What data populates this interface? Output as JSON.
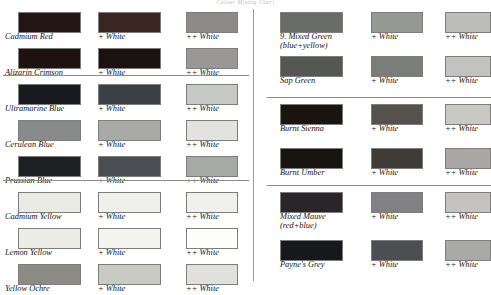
{
  "page": {
    "title": "Colour Mixing Chart",
    "mix_label_1": "+ White",
    "mix_label_2": "++ White"
  },
  "chart_data": {
    "type": "table",
    "title": "Colour Mixing Chart",
    "columns": [
      "Base Colour",
      "+ White",
      "++ White"
    ],
    "panels": [
      {
        "side": "left",
        "groups": [
          {
            "rows": [
              {
                "name": "Cadmium Red",
                "subtitle": "",
                "swatches": [
                  "#231513",
                  "#3a2523",
                  "#8d8a88"
                ]
              },
              {
                "name": "Alizarin Crimson",
                "subtitle": "",
                "swatches": [
                  "#1d1210",
                  "#1a1210",
                  "#9a9896"
                ]
              }
            ]
          },
          {
            "rows": [
              {
                "name": "Ultramarine Blue",
                "subtitle": "",
                "swatches": [
                  "#181a20",
                  "#3c3f45",
                  "#c6c8c6"
                ]
              },
              {
                "name": "Cerulean Blue",
                "subtitle": "",
                "swatches": [
                  "#898b8a",
                  "#a9aaa8",
                  "#e2e3e1"
                ]
              },
              {
                "name": "Prussian Blue",
                "subtitle": "",
                "swatches": [
                  "#1e2024",
                  "#4a4d51",
                  "#a7a9a7"
                ]
              }
            ]
          },
          {
            "rows": [
              {
                "name": "Cadmium Yellow",
                "subtitle": "",
                "swatches": [
                  "#e9eae4",
                  "#eff0ec",
                  "#f0f1ed"
                ]
              },
              {
                "name": "Lemon Yellow",
                "subtitle": "",
                "swatches": [
                  "#ecede7",
                  "#f4f5f1",
                  "#fdfdfc"
                ]
              },
              {
                "name": "Yellow Ochre",
                "subtitle": "",
                "swatches": [
                  "#8c8b85",
                  "#c9cac4",
                  "#e0e1dc"
                ]
              }
            ]
          }
        ]
      },
      {
        "side": "right",
        "groups": [
          {
            "rows": [
              {
                "name": "9. Mixed Green",
                "subtitle": "(blue+yellow)",
                "swatches": [
                  "#6a6c68",
                  "#969893",
                  "#bcbdb8"
                ]
              },
              {
                "name": "Sap Green",
                "subtitle": "",
                "swatches": [
                  "#555753",
                  "#7b7d78",
                  "#c2c3be"
                ]
              }
            ]
          },
          {
            "rows": [
              {
                "name": "Burnt Sienna",
                "subtitle": "",
                "swatches": [
                  "#1a1411",
                  "#55514d",
                  "#c9c8c3"
                ]
              },
              {
                "name": "Burnt Umber",
                "subtitle": "",
                "swatches": [
                  "#161310",
                  "#3e3b38",
                  "#a8a7a3"
                ]
              }
            ]
          },
          {
            "rows": [
              {
                "name": "Mixed Mauve",
                "subtitle": "(red+blue)",
                "swatches": [
                  "#2a2529",
                  "#818082",
                  "#c4c3c2"
                ]
              },
              {
                "name": "Payne's Grey",
                "subtitle": "",
                "swatches": [
                  "#17181c",
                  "#4c4e51",
                  "#a9aaa8"
                ]
              }
            ]
          }
        ]
      }
    ]
  }
}
